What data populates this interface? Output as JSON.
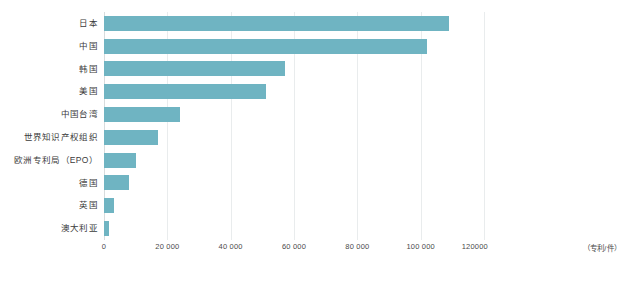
{
  "chart_data": {
    "type": "bar",
    "orientation": "horizontal",
    "title": "",
    "xlabel": "",
    "ylabel": "",
    "unit_annotation": "（专利/件）",
    "xlim": [
      0,
      120000
    ],
    "grid": true,
    "legend": "none",
    "bar_color": "#6fb4c2",
    "xticks": [
      0,
      20000,
      40000,
      60000,
      80000,
      100000,
      120000
    ],
    "xtick_labels": [
      "0",
      "20 000",
      "40 000",
      "60 000",
      "80 000",
      "100 000",
      "120000"
    ],
    "categories": [
      "日本",
      "中国",
      "韩国",
      "美国",
      "中国台湾",
      "世界知识产权组织",
      "欧洲专利局（EPO）",
      "德国",
      "英国",
      "澳大利亚"
    ],
    "values": [
      109000,
      102000,
      57000,
      51000,
      24000,
      17000,
      10000,
      8000,
      3000,
      1500
    ]
  }
}
